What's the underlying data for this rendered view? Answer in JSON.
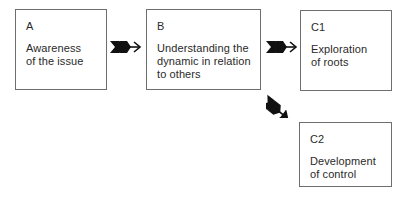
{
  "diagram": {
    "type": "flow",
    "boxes": [
      {
        "id": "A",
        "label": "A",
        "description": "Awareness\nof the issue"
      },
      {
        "id": "B",
        "label": "B",
        "description": "Understanding the\ndynamic in relation\nto others"
      },
      {
        "id": "C1",
        "label": "C1",
        "description": "Exploration\nof roots"
      },
      {
        "id": "C2",
        "label": "C2",
        "description": "Development\nof control"
      }
    ],
    "edges": [
      {
        "from": "A",
        "to": "B",
        "icon": "fletched-arrow-right-icon"
      },
      {
        "from": "B",
        "to": "C1",
        "icon": "fletched-arrow-right-icon"
      },
      {
        "from": "B",
        "to": "C2",
        "icon": "fletched-arrow-diagonal-down-right-icon"
      }
    ],
    "colors": {
      "border": "#6e6e6e",
      "text": "#2a2a2a",
      "arrow": "#111111",
      "background": "#ffffff"
    }
  }
}
